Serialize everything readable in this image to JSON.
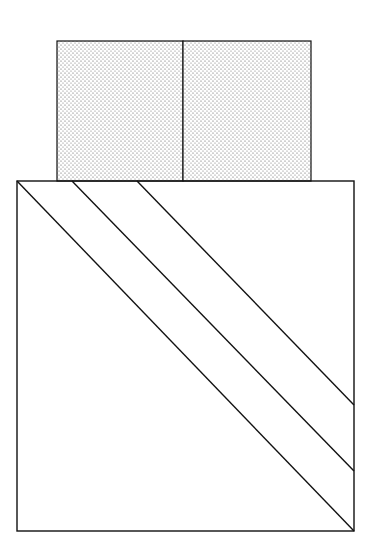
{
  "diagram": {
    "colors": {
      "background": "#ffffff",
      "stroke": "#111111",
      "stipple_dot": "#555555"
    },
    "top_block": {
      "x": 57,
      "y": 41,
      "width": 254,
      "height": 140,
      "divider_x": 183,
      "fill": "stipple"
    },
    "bottom_square": {
      "x": 17,
      "y": 181,
      "width": 337,
      "height": 350
    },
    "diagonals": [
      {
        "x1": 17,
        "y1": 181,
        "x2": 354,
        "y2": 531
      },
      {
        "x1": 72,
        "y1": 181,
        "x2": 354,
        "y2": 471
      },
      {
        "x1": 137,
        "y1": 181,
        "x2": 354,
        "y2": 405
      }
    ]
  }
}
